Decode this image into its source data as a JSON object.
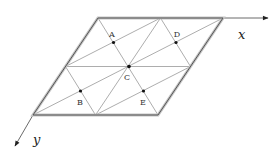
{
  "diagram": {
    "type": "triangular lattice in parallelogram cell",
    "axes": [
      {
        "name": "x",
        "label": "x"
      },
      {
        "name": "y",
        "label": "y"
      }
    ],
    "points": [
      {
        "label": "A"
      },
      {
        "label": "B"
      },
      {
        "label": "C"
      },
      {
        "label": "D"
      },
      {
        "label": "E"
      }
    ],
    "colors": {
      "border": "#555555",
      "border_highlight": "#bbbbbb",
      "grid_line": "#888888",
      "point": "#111111"
    }
  }
}
